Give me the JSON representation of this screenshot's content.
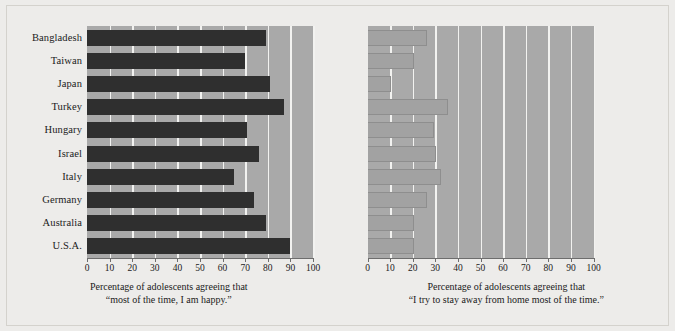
{
  "figure": {
    "background_color": "#edecea",
    "plot_background_color": "#a9a9a9",
    "gridline_color": "#f2f2f0",
    "dark_bar_color": "#2f2f2f",
    "light_bar_color": "#a2a2a2"
  },
  "chart_data": [
    {
      "type": "bar",
      "orientation": "horizontal",
      "title": "",
      "xlabel": "Percentage of adolescents agreeing that “most of the time, I am happy.”",
      "ylabel": "",
      "caption_line1": "Percentage of adolescents agreeing that",
      "caption_line2": "“most of the time, I am happy.”",
      "categories": [
        "Bangladesh",
        "Taiwan",
        "Japan",
        "Turkey",
        "Hungary",
        "Israel",
        "Italy",
        "Germany",
        "Australia",
        "U.S.A."
      ],
      "values": [
        79,
        70,
        81,
        87,
        71,
        76,
        65,
        74,
        79,
        90
      ],
      "xlim": [
        0,
        100
      ],
      "xticks": [
        0,
        10,
        20,
        30,
        40,
        50,
        60,
        70,
        80,
        90,
        100
      ],
      "xticklabels": [
        "0",
        "10",
        "20",
        "30",
        "40",
        "50",
        "60",
        "70",
        "80",
        "90",
        "100"
      ],
      "grid": true,
      "legend": "none",
      "bar_style": "dark"
    },
    {
      "type": "bar",
      "orientation": "horizontal",
      "title": "",
      "xlabel": "Percentage of adolescents agreeing that “I try to stay away from home most of the time.”",
      "ylabel": "",
      "caption_line1": "Percentage of adolescents agreeing that",
      "caption_line2": "“I try to stay away from home most of the time.”",
      "categories": [
        "Bangladesh",
        "Taiwan",
        "Japan",
        "Turkey",
        "Hungary",
        "Israel",
        "Italy",
        "Germany",
        "Australia",
        "U.S.A."
      ],
      "values": [
        26,
        20,
        10,
        35,
        29,
        30,
        32,
        26,
        20,
        20
      ],
      "xlim": [
        0,
        100
      ],
      "xticks": [
        0,
        10,
        20,
        30,
        40,
        50,
        60,
        70,
        80,
        90,
        100
      ],
      "xticklabels": [
        "0",
        "10",
        "20",
        "30",
        "40",
        "50",
        "60",
        "70",
        "80",
        "90",
        "100"
      ],
      "grid": true,
      "legend": "none",
      "bar_style": "light"
    }
  ]
}
